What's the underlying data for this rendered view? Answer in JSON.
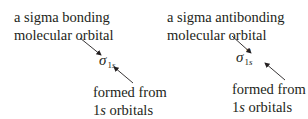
{
  "left": {
    "label_line1": "a sigma bonding",
    "label_line2": "molecular orbital",
    "symbol": "σ",
    "subscript_num": "1",
    "subscript_s": "s",
    "source_line1": "formed from",
    "source_line2_num": "1",
    "source_line2_s": "s",
    "source_line2_rest": " orbitals"
  },
  "right": {
    "label_line1": "a sigma antibonding",
    "label_line2": "molecular orbital",
    "symbol": "σ",
    "star": "*",
    "subscript_num": "1",
    "subscript_s": "s",
    "source_line1": "formed from",
    "source_line2_num": "1",
    "source_line2_s": "s",
    "source_line2_rest": " orbitals"
  },
  "colors": {
    "text": "#231f20",
    "arrow": "#231f20"
  }
}
